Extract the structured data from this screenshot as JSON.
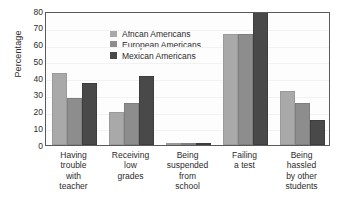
{
  "chart_data": {
    "type": "bar",
    "title": "",
    "xlabel": "",
    "ylabel": "Percentage",
    "ylim": [
      0,
      80
    ],
    "yticks": [
      80,
      70,
      60,
      50,
      40,
      30,
      20,
      10,
      0
    ],
    "grid": false,
    "legend_position": "top-left inside plot",
    "categories": [
      "Having trouble with teacher",
      "Receiving low grades",
      "Being suspended from school",
      "Failing a test",
      "Being hassled by other students"
    ],
    "category_lines": [
      [
        "Having",
        "trouble",
        "with",
        "teacher"
      ],
      [
        "Receiving",
        "low",
        "grades"
      ],
      [
        "Being",
        "suspended",
        "from",
        "school"
      ],
      [
        "Failing",
        "a test"
      ],
      [
        "Being",
        "hassled",
        "by other",
        "students"
      ]
    ],
    "series": [
      {
        "name": "African Americans",
        "color": "#a9a9a9",
        "values": [
          43,
          20,
          1,
          66,
          32
        ]
      },
      {
        "name": "European Americans",
        "color": "#8d8d8d",
        "values": [
          28,
          25,
          1,
          66,
          25
        ]
      },
      {
        "name": "Mexican Americans",
        "color": "#494949",
        "values": [
          37,
          41,
          1,
          80,
          15
        ]
      }
    ]
  }
}
